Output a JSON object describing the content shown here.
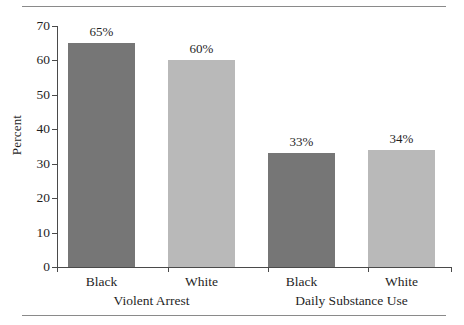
{
  "chart_data": {
    "type": "bar",
    "title": "",
    "xlabel": "",
    "ylabel": "Percent",
    "ylim": [
      0,
      70
    ],
    "ytick_values": [
      70,
      60,
      50,
      40,
      30,
      20,
      10,
      0
    ],
    "ytick_labels": [
      "70",
      "60",
      "50",
      "40",
      "30",
      "20",
      "10",
      "0"
    ],
    "grid": false,
    "legend": "none",
    "categories": [
      "Black",
      "White",
      "Black",
      "White"
    ],
    "groups": [
      {
        "label": "Violent Arrest",
        "categories": [
          "Black",
          "White"
        ],
        "values": [
          65,
          60
        ]
      },
      {
        "label": "Daily Substance Use",
        "categories": [
          "Black",
          "White"
        ],
        "values": [
          33,
          34
        ]
      }
    ],
    "values": [
      65,
      60,
      33,
      34
    ],
    "data_labels": [
      "65%",
      "60%",
      "33%",
      "34%"
    ],
    "bars": [
      {
        "group": "Violent Arrest",
        "category": "Black",
        "value": 65,
        "label": "65%",
        "color": "#767676"
      },
      {
        "group": "Violent Arrest",
        "category": "White",
        "value": 60,
        "label": "60%",
        "color": "#b9b9b9"
      },
      {
        "group": "Daily Substance Use",
        "category": "Black",
        "value": 33,
        "label": "33%",
        "color": "#767676"
      },
      {
        "group": "Daily Substance Use",
        "category": "White",
        "value": 34,
        "label": "34%",
        "color": "#b9b9b9"
      }
    ],
    "colors": {
      "black_bar": "#767676",
      "white_bar": "#b9b9b9",
      "axis": "#4a4a4a",
      "rule": "#8a8a8a",
      "text": "#1f1f1f",
      "background": "#ffffff"
    }
  }
}
